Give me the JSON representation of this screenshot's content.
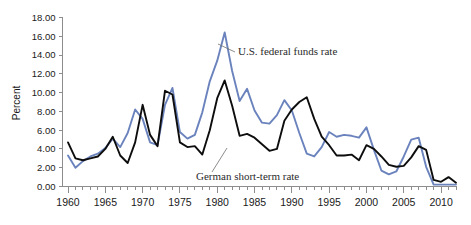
{
  "chart_data": {
    "type": "line",
    "title": "",
    "xlabel": "",
    "ylabel": "Percent",
    "ylim": [
      0,
      18
    ],
    "xlim": [
      1960,
      2012
    ],
    "grid": false,
    "legend_position": "inline-annotations",
    "y_ticks": [
      "0.00",
      "2.00",
      "4.00",
      "6.00",
      "8.00",
      "10.00",
      "12.00",
      "14.00",
      "16.00",
      "18.00"
    ],
    "y_tick_values": [
      0,
      2,
      4,
      6,
      8,
      10,
      12,
      14,
      16,
      18
    ],
    "x_ticks": [
      "1960",
      "1965",
      "1970",
      "1975",
      "1980",
      "1985",
      "1990",
      "1995",
      "2000",
      "2005",
      "2010"
    ],
    "x_tick_values": [
      1960,
      1965,
      1970,
      1975,
      1980,
      1985,
      1990,
      1995,
      2000,
      2005,
      2010
    ],
    "x_minor_tick_step": 1,
    "x": [
      1960,
      1961,
      1962,
      1963,
      1964,
      1965,
      1966,
      1967,
      1968,
      1969,
      1970,
      1971,
      1972,
      1973,
      1974,
      1975,
      1976,
      1977,
      1978,
      1979,
      1980,
      1981,
      1982,
      1983,
      1984,
      1985,
      1986,
      1987,
      1988,
      1989,
      1990,
      1991,
      1992,
      1993,
      1994,
      1995,
      1996,
      1997,
      1998,
      1999,
      2000,
      2001,
      2002,
      2003,
      2004,
      2005,
      2006,
      2007,
      2008,
      2009,
      2010,
      2011,
      2012
    ],
    "series": [
      {
        "name": "U.S. federal funds rate",
        "color": "#6b83bd",
        "values": [
          3.3,
          2.0,
          2.7,
          3.2,
          3.5,
          4.1,
          5.1,
          4.2,
          5.7,
          8.2,
          7.2,
          4.7,
          4.4,
          8.7,
          10.5,
          5.8,
          5.1,
          5.5,
          7.9,
          11.2,
          13.4,
          16.4,
          12.3,
          9.1,
          10.4,
          8.1,
          6.8,
          6.7,
          7.6,
          9.2,
          8.1,
          5.7,
          3.5,
          3.2,
          4.2,
          5.8,
          5.3,
          5.5,
          5.4,
          5.2,
          6.3,
          3.9,
          1.7,
          1.3,
          1.6,
          3.2,
          5.0,
          5.2,
          2.1,
          0.2,
          0.2,
          0.2,
          0.2
        ]
      },
      {
        "name": "German short-term rate",
        "color": "#0d0d0d",
        "values": [
          4.7,
          3.0,
          2.8,
          3.0,
          3.2,
          4.0,
          5.3,
          3.3,
          2.5,
          4.7,
          8.7,
          5.5,
          4.3,
          10.2,
          9.8,
          4.7,
          4.2,
          4.3,
          3.4,
          6.0,
          9.4,
          11.3,
          8.6,
          5.4,
          5.6,
          5.2,
          4.5,
          3.8,
          4.0,
          7.0,
          8.2,
          9.0,
          9.5,
          7.2,
          5.3,
          4.4,
          3.3,
          3.3,
          3.4,
          2.8,
          4.4,
          4.0,
          3.2,
          2.3,
          2.1,
          2.2,
          3.1,
          4.3,
          3.9,
          0.7,
          0.5,
          1.0,
          0.4
        ]
      }
    ],
    "annotations": [
      {
        "text": "U.S. federal funds rate",
        "series": "U.S. federal funds rate",
        "label_x": 238,
        "label_y": 55,
        "leader_from_x": 235,
        "leader_from_y": 52,
        "leader_to_x": 218,
        "leader_to_y": 44
      },
      {
        "text": "German short-term rate",
        "series": "German short-term rate",
        "label_x": 196,
        "label_y": 180,
        "leader_from_x": 212,
        "leader_from_y": 172,
        "leader_to_x": 227,
        "leader_to_y": 148
      }
    ]
  },
  "axis": {
    "y_label": "Percent"
  }
}
